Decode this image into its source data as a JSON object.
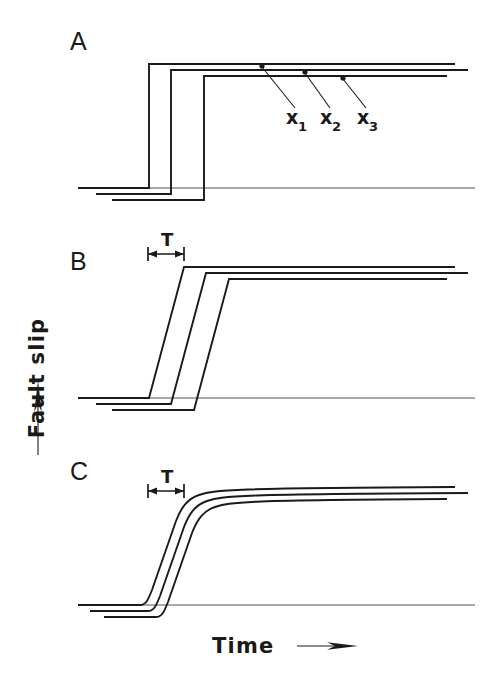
{
  "figure": {
    "axes": {
      "y_label": "Fault slip",
      "x_label": "Time",
      "y_arrow": "up-arrow",
      "x_arrow": "right-arrow"
    },
    "panels": [
      {
        "letter": "A",
        "type": "step",
        "duration_label": null,
        "baseline_y": 188,
        "plateau_y": 64,
        "axis_x_start": 78,
        "axis_x_end": 475,
        "traces": [
          {
            "name": "x1",
            "onset_x": 149,
            "baseline_y": 188,
            "plateau_y": 64,
            "end_x": 455,
            "baseline_x_start": 78
          },
          {
            "name": "x2",
            "onset_x": 171,
            "baseline_y": 194,
            "plateau_y": 70,
            "end_x": 468,
            "baseline_x_start": 96
          },
          {
            "name": "x3",
            "onset_x": 204,
            "baseline_y": 200,
            "plateau_y": 76,
            "end_x": 447,
            "baseline_x_start": 112
          }
        ],
        "station_labels": [
          {
            "text": "x",
            "sub": "1",
            "x": 292,
            "y": 122,
            "point_x": 262,
            "point_y": 67
          },
          {
            "text": "x",
            "sub": "2",
            "x": 326,
            "y": 122,
            "point_x": 305,
            "point_y": 72
          },
          {
            "text": "x",
            "sub": "3",
            "x": 363,
            "y": 122,
            "point_x": 343,
            "point_y": 78
          }
        ]
      },
      {
        "letter": "B",
        "type": "ramp",
        "duration_label": "T",
        "baseline_y": 398,
        "plateau_y": 267,
        "axis_x_start": 78,
        "axis_x_end": 475,
        "rise_time_px": 35,
        "traces": [
          {
            "name": "x1",
            "onset_x": 149,
            "baseline_y": 398,
            "plateau_y": 267,
            "end_x": 455,
            "baseline_x_start": 78
          },
          {
            "name": "x2",
            "onset_x": 171,
            "baseline_y": 404,
            "plateau_y": 273,
            "end_x": 468,
            "baseline_x_start": 96
          },
          {
            "name": "x3",
            "onset_x": 194,
            "baseline_y": 410,
            "plateau_y": 279,
            "end_x": 447,
            "baseline_x_start": 112
          }
        ],
        "t_marker": {
          "x_start": 148,
          "x_end": 184,
          "y": 253,
          "label_x": 166,
          "label_y": 243
        }
      },
      {
        "letter": "C",
        "type": "sigmoid",
        "duration_label": "T",
        "baseline_y": 605,
        "plateau_y": 487,
        "axis_x_start": 78,
        "axis_x_end": 475,
        "rise_time_px": 35,
        "traces": [
          {
            "name": "x1",
            "onset_x": 147,
            "baseline_y": 605,
            "plateau_y": 487,
            "end_x": 455,
            "baseline_x_start": 78
          },
          {
            "name": "x2",
            "onset_x": 155,
            "baseline_y": 611,
            "plateau_y": 493,
            "end_x": 468,
            "baseline_x_start": 90
          },
          {
            "name": "x3",
            "onset_x": 163,
            "baseline_y": 617,
            "plateau_y": 499,
            "end_x": 447,
            "baseline_x_start": 104
          }
        ],
        "t_marker": {
          "x_start": 148,
          "x_end": 184,
          "y": 490,
          "label_x": 166,
          "label_y": 480
        }
      }
    ],
    "colors": {
      "ink": "#1a1a1a",
      "axis": "#555555",
      "background": "#ffffff"
    }
  }
}
